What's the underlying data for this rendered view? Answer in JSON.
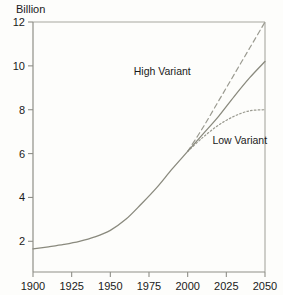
{
  "chart_data": {
    "type": "line",
    "title": "",
    "subtitle": "",
    "xlabel": "",
    "ylabel": "Billion",
    "unit_label": "Billion",
    "xlim": [
      1900,
      2050
    ],
    "ylim": [
      0.6,
      12
    ],
    "grid": false,
    "legend_position": "inline-annotations",
    "x_ticks": [
      1900,
      1925,
      1950,
      1975,
      2000,
      2025,
      2050
    ],
    "x_tick_labels": [
      "1900",
      "1925",
      "1950",
      "1975",
      "2000",
      "2025",
      "2050"
    ],
    "y_ticks": [
      2,
      4,
      6,
      8,
      10,
      12
    ],
    "y_tick_labels": [
      "2",
      "4",
      "6",
      "8",
      "10",
      "12"
    ],
    "annotations": [
      {
        "text": "High Variant",
        "x": 2002,
        "y": 9.6
      },
      {
        "text": "Low Variant",
        "x": 2016,
        "y": 6.45
      }
    ],
    "series": [
      {
        "name": "Medium Variant",
        "style": "solid",
        "color": "#8a8a7e",
        "x": [
          1900,
          1910,
          1920,
          1930,
          1940,
          1950,
          1960,
          1970,
          1980,
          1990,
          2000,
          2010,
          2020,
          2030,
          2040,
          2050
        ],
        "values": [
          1.65,
          1.75,
          1.86,
          2.0,
          2.2,
          2.5,
          3.0,
          3.7,
          4.45,
          5.3,
          6.1,
          6.9,
          7.7,
          8.6,
          9.45,
          10.2
        ]
      },
      {
        "name": "High Variant",
        "style": "dashed",
        "color": "#9a9a90",
        "x": [
          2000,
          2010,
          2020,
          2030,
          2040,
          2050
        ],
        "values": [
          6.1,
          7.2,
          8.4,
          9.6,
          10.8,
          12.0
        ]
      },
      {
        "name": "Low Variant",
        "style": "dotted",
        "color": "#9a9a90",
        "x": [
          2000,
          2010,
          2020,
          2030,
          2040,
          2050
        ],
        "values": [
          6.1,
          6.75,
          7.3,
          7.7,
          7.95,
          8.0
        ]
      }
    ]
  },
  "colors": {
    "background": "#fdfdfb",
    "axis": "#8f8f88",
    "frame": "#a8a8a0",
    "text": "#1a1a1a",
    "medium_variant": "#8a8a7e",
    "high_variant": "#9a9a90",
    "low_variant": "#9a9a90"
  }
}
